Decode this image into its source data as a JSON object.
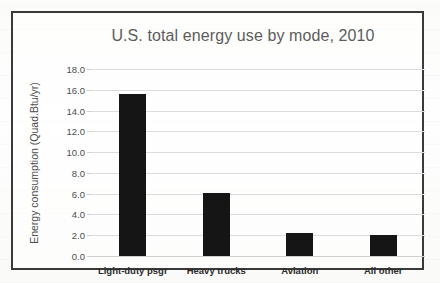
{
  "chart_data": {
    "type": "bar",
    "title": "U.S. total energy use by mode, 2010",
    "xlabel": "",
    "ylabel": "Energy consumption (Quad.Btu/yr)",
    "categories": [
      "Light-duty psgr",
      "Heavy trucks",
      "Aviation",
      "All other"
    ],
    "values": [
      15.6,
      6.1,
      2.2,
      2.0
    ],
    "ylim": [
      0.0,
      18.0
    ],
    "ytick_step": 2.0,
    "ytick_labels": [
      "0.0",
      "2.0",
      "4.0",
      "6.0",
      "8.0",
      "10.0",
      "12.0",
      "14.0",
      "16.0",
      "18.0"
    ],
    "grid": true,
    "legend": false,
    "bar_color": "#151515",
    "gridline_color": "#dcdcdc",
    "title_color": "#5c5c5c",
    "frame_color": "#3a3a3a"
  }
}
